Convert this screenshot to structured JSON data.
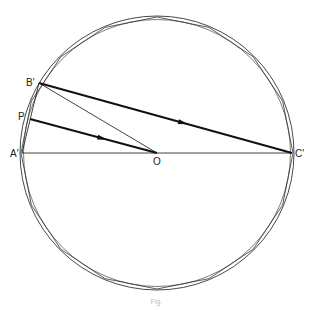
{
  "figure": {
    "caption": "Fig.",
    "center": {
      "x": 157,
      "y": 153
    },
    "outer_radius": 137,
    "inner_radius": 133.5,
    "polygon_sides": 16,
    "labels": {
      "A": "A'",
      "B": "B'",
      "C": "C'",
      "P": "P",
      "O": "O"
    },
    "points": {
      "A": {
        "x": 22,
        "y": 153
      },
      "B": {
        "x": 39,
        "y": 83
      },
      "C": {
        "x": 292,
        "y": 153
      },
      "P": {
        "x": 30,
        "y": 119
      },
      "O": {
        "x": 157,
        "y": 153
      }
    },
    "segments": [
      {
        "from": "A",
        "to": "C",
        "weight": "thin",
        "arrow": false
      },
      {
        "from": "B",
        "to": "O",
        "weight": "thin",
        "arrow": false
      },
      {
        "from": "B",
        "to": "C",
        "weight": "thick",
        "arrow": true
      },
      {
        "from": "P",
        "to": "O",
        "weight": "thick",
        "arrow": true
      },
      {
        "from": "A",
        "to": "B",
        "weight": "thin",
        "arrow": false
      }
    ]
  }
}
